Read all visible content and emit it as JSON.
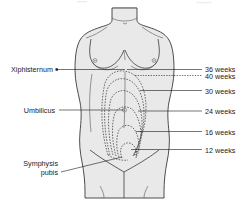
{
  "figure": {
    "body_fill_color": "#e9e9e9",
    "outline_color": "#3a3a3a",
    "text_color": "#1a1a1a",
    "background_color": "#ffffff"
  },
  "anatomy_labels": [
    {
      "id": "xiphisternum",
      "text": "Xiphisternum",
      "side": "left"
    },
    {
      "id": "umbilicus",
      "text": "Umbilicus",
      "side": "left"
    },
    {
      "id": "symphysis-pubis-line1",
      "text": "Symphysis",
      "side": "left"
    },
    {
      "id": "symphysis-pubis-line2",
      "text": "pubis",
      "side": "left"
    }
  ],
  "gestation_labels": [
    {
      "id": "w36",
      "text": "36 weeks",
      "weeks": 36,
      "line_style": "solid"
    },
    {
      "id": "w40",
      "text": "40 weeks",
      "weeks": 40,
      "line_style": "dotted"
    },
    {
      "id": "w30",
      "text": "30 weeks",
      "weeks": 30,
      "line_style": "solid"
    },
    {
      "id": "w24",
      "text": "24 weeks",
      "weeks": 24,
      "line_style": "solid"
    },
    {
      "id": "w16",
      "text": "16 weeks",
      "weeks": 16,
      "line_style": "solid"
    },
    {
      "id": "w12",
      "text": "12 weeks",
      "weeks": 12,
      "line_style": "solid"
    }
  ]
}
